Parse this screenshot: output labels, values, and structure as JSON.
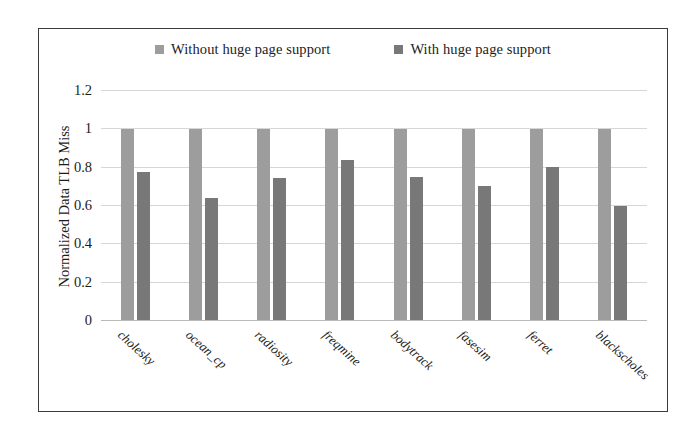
{
  "chart_data": {
    "type": "bar",
    "title": "",
    "xlabel": "",
    "ylabel": "Normalized Data TLB Miss",
    "ylim": [
      0,
      1.2
    ],
    "ytick_labels": [
      "1.2",
      "1",
      "0.8",
      "0.6",
      "0.4",
      "0.2",
      "0"
    ],
    "ytick_values": [
      1.2,
      1,
      0.8,
      0.6,
      0.4,
      0.2,
      0
    ],
    "grid": true,
    "legend_position": "top-center",
    "categories": [
      "cholesky",
      "ocean_cp",
      "radiosity",
      "freqmine",
      "bodytrack",
      "fasesim",
      "ferret",
      "blackscholes"
    ],
    "series": [
      {
        "name": "Without huge page support",
        "color": "#9d9d9d",
        "values": [
          1,
          1,
          1,
          1,
          1,
          1,
          1,
          1
        ]
      },
      {
        "name": "With huge page support",
        "color": "#787878",
        "values": [
          0.78,
          0.64,
          0.745,
          0.84,
          0.75,
          0.705,
          0.805,
          0.6
        ]
      }
    ]
  },
  "legend": {
    "entries": [
      {
        "label": "Without huge page support",
        "color": "#9d9d9d"
      },
      {
        "label": "With huge page support",
        "color": "#787878"
      }
    ]
  }
}
